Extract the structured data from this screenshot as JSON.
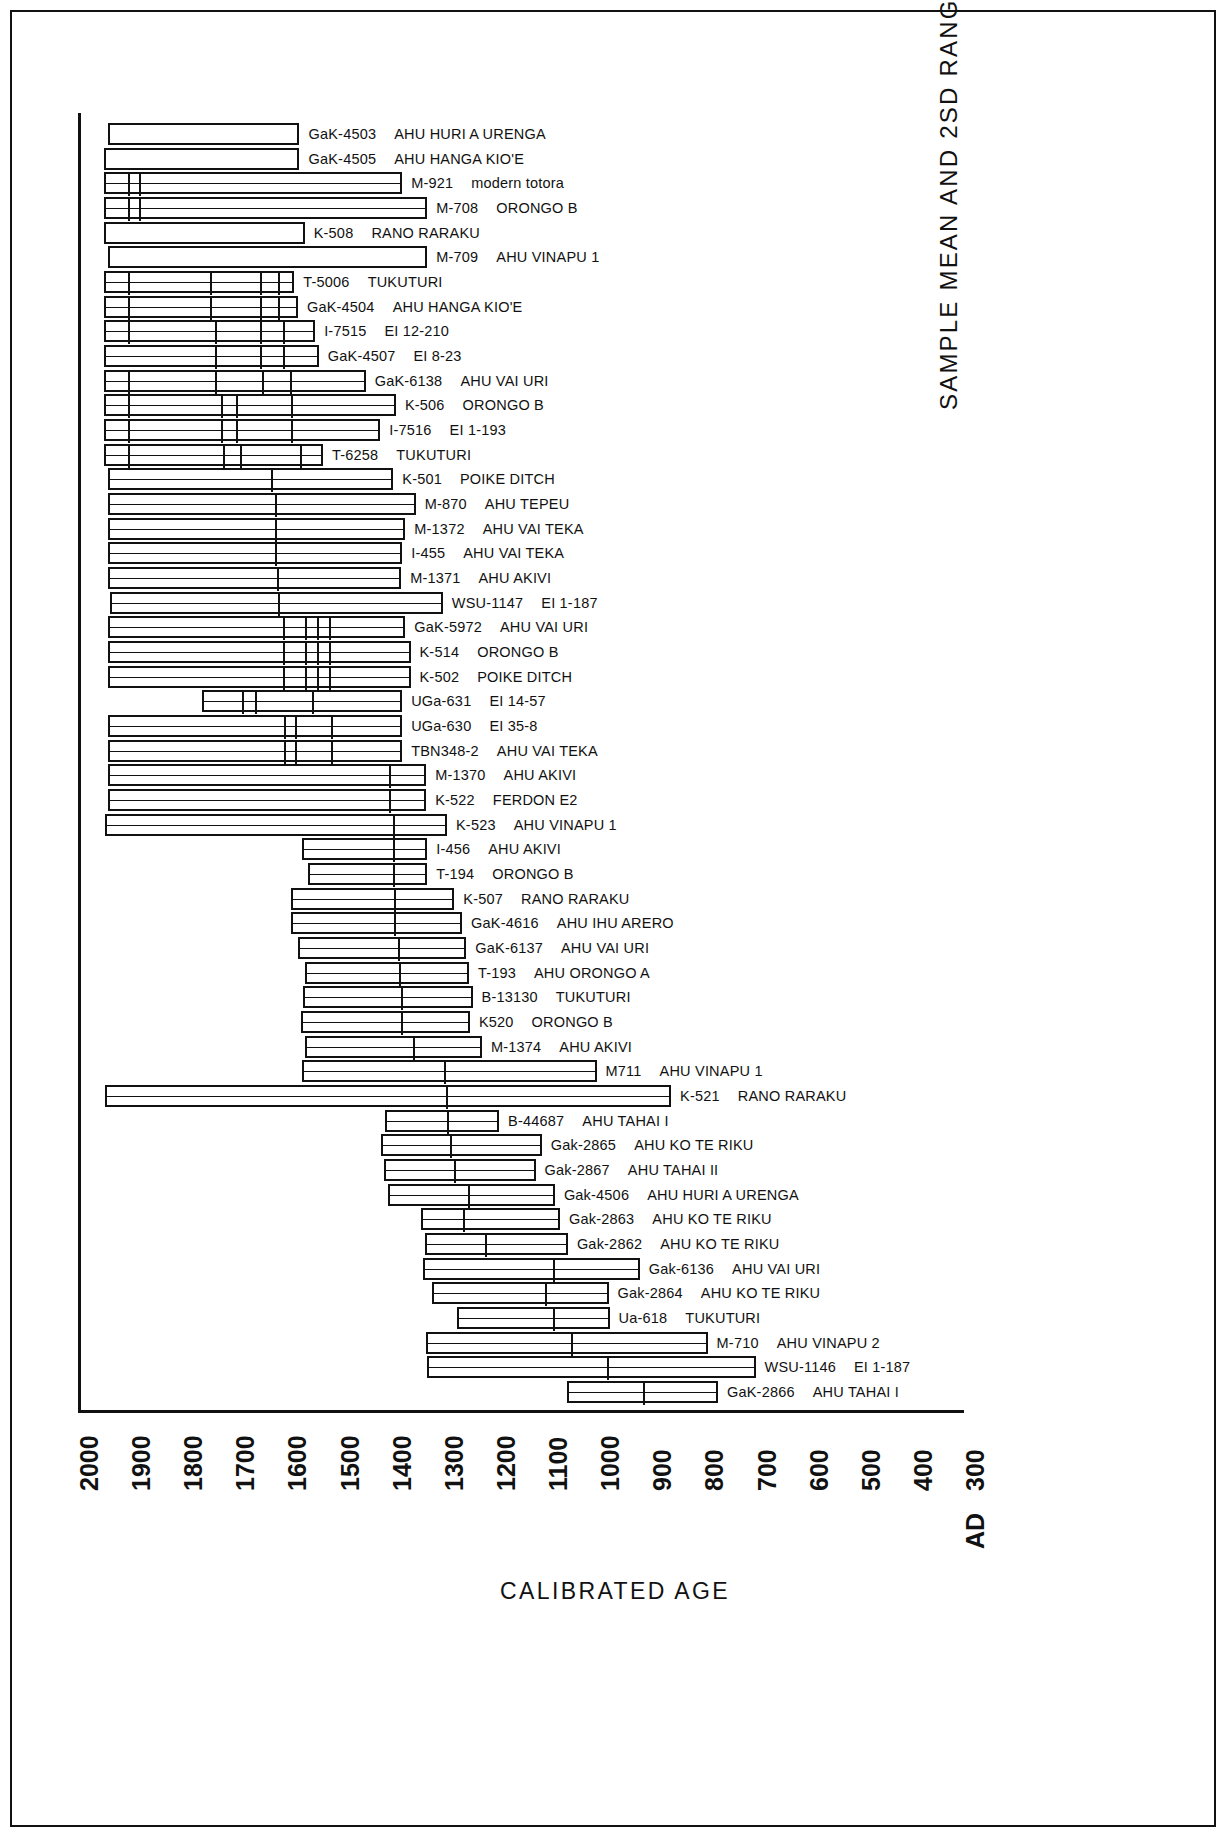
{
  "figure": {
    "xaxis_title": "CALIBRATED  AGE",
    "yaxis_title": "SAMPLE  MEAN  AND  2SD  RANGE"
  },
  "chart_data": {
    "type": "bar",
    "orientation": "horizontal",
    "title": "",
    "xlabel": "CALIBRATED  AGE",
    "ylabel": "SAMPLE  MEAN  AND  2SD  RANGE",
    "xlim": [
      2000,
      300
    ],
    "x_reversed": true,
    "grid": false,
    "legend": null,
    "xticks": [
      "2000",
      "1900",
      "1800",
      "1700",
      "1600",
      "1500",
      "1400",
      "1300",
      "1200",
      "1100",
      "1000",
      "900",
      "800",
      "700",
      "600",
      "500",
      "400",
      "300"
    ],
    "x_tick_values": [
      2000,
      1900,
      1800,
      1700,
      1600,
      1500,
      1400,
      1300,
      1200,
      1100,
      1000,
      900,
      800,
      700,
      600,
      500,
      400,
      300
    ],
    "x_axis_era_prefix": "AD",
    "value_unit": "calibrated years AD",
    "note": "Each bar spans the 2 sigma (2SD) calibrated age range; interior vertical lines mark the sample mean and sub-range divisions.",
    "series": [
      {
        "code": "GaK-4503",
        "site": "AHU  HURI A  URENGA",
        "start": 1942,
        "end": 1575,
        "dividers": []
      },
      {
        "code": "GaK-4505",
        "site": "AHU  HANGA  KIO'E",
        "start": 1950,
        "end": 1575,
        "dividers": []
      },
      {
        "code": "M-921",
        "site": "modern totora",
        "start": 1950,
        "end": 1378,
        "dividers": [
          1908,
          1886
        ]
      },
      {
        "code": "M-708",
        "site": "ORONGO  B",
        "start": 1950,
        "end": 1330,
        "dividers": [
          1908,
          1886
        ]
      },
      {
        "code": "K-508",
        "site": "RANO  RARAKU",
        "start": 1950,
        "end": 1565,
        "dividers": []
      },
      {
        "code": "M-709",
        "site": "AHU  VINAPU  1",
        "start": 1942,
        "end": 1330,
        "dividers": []
      },
      {
        "code": "T-5006",
        "site": "TUKUTURI",
        "start": 1950,
        "end": 1585,
        "dividers": [
          1908,
          1750,
          1655,
          1620
        ]
      },
      {
        "code": "GaK-4504",
        "site": "AHU  HANGA  KIO'E",
        "start": 1950,
        "end": 1578,
        "dividers": [
          1908,
          1750,
          1655,
          1620
        ]
      },
      {
        "code": "I-7515",
        "site": "EI 12-210",
        "start": 1950,
        "end": 1545,
        "dividers": [
          1908,
          1740,
          1655,
          1610
        ]
      },
      {
        "code": "GaK-4507",
        "site": "EI 8-23",
        "start": 1950,
        "end": 1538,
        "dividers": [
          1740,
          1655,
          1610
        ]
      },
      {
        "code": "GaK-6138",
        "site": "AHU  VAI URI",
        "start": 1950,
        "end": 1448,
        "dividers": [
          1908,
          1740,
          1650,
          1597
        ]
      },
      {
        "code": "K-506",
        "site": "ORONGO  B",
        "start": 1950,
        "end": 1390,
        "dividers": [
          1908,
          1730,
          1700,
          1595
        ]
      },
      {
        "code": "I-7516",
        "site": "EI 1-193",
        "start": 1950,
        "end": 1420,
        "dividers": [
          1908,
          1730,
          1700,
          1595
        ]
      },
      {
        "code": "T-6258",
        "site": "TUKUTURI",
        "start": 1950,
        "end": 1530,
        "dividers": [
          1908,
          1725,
          1693,
          1578
        ]
      },
      {
        "code": "K-501",
        "site": "POIKE  DITCH",
        "start": 1942,
        "end": 1395,
        "dividers": [
          1633
        ]
      },
      {
        "code": "M-870",
        "site": "AHU  TEPEU",
        "start": 1942,
        "end": 1352,
        "dividers": [
          1625
        ]
      },
      {
        "code": "M-1372",
        "site": "AHU  VAI TEKA",
        "start": 1942,
        "end": 1372,
        "dividers": [
          1625
        ]
      },
      {
        "code": "I-455",
        "site": "AHU  VAI TEKA",
        "start": 1942,
        "end": 1378,
        "dividers": [
          1625
        ]
      },
      {
        "code": "M-1371",
        "site": "AHU  AKIVI",
        "start": 1942,
        "end": 1380,
        "dividers": [
          1622
        ]
      },
      {
        "code": "WSU-1147",
        "site": "EI 1-187",
        "start": 1938,
        "end": 1300,
        "dividers": [
          1620
        ]
      },
      {
        "code": "GaK-5972",
        "site": "AHU  VAI URI",
        "start": 1942,
        "end": 1372,
        "dividers": [
          1610,
          1568,
          1545,
          1522
        ]
      },
      {
        "code": "K-514",
        "site": "ORONGO  B",
        "start": 1942,
        "end": 1362,
        "dividers": [
          1610,
          1568,
          1545,
          1522
        ]
      },
      {
        "code": "K-502",
        "site": "POIKE  DITCH",
        "start": 1942,
        "end": 1362,
        "dividers": [
          1610,
          1568,
          1545,
          1522
        ]
      },
      {
        "code": "UGa-631",
        "site": "EI 14-57",
        "start": 1762,
        "end": 1378,
        "dividers": [
          1690,
          1665,
          1555
        ]
      },
      {
        "code": "UGa-630",
        "site": "EI 35-8",
        "start": 1942,
        "end": 1378,
        "dividers": [
          1608,
          1588,
          1518
        ]
      },
      {
        "code": "TBN348-2",
        "site": "AHU  VAI TEKA",
        "start": 1942,
        "end": 1378,
        "dividers": [
          1608,
          1588,
          1518
        ]
      },
      {
        "code": "M-1370",
        "site": "AHU  AKIVI",
        "start": 1942,
        "end": 1332,
        "dividers": [
          1408
        ]
      },
      {
        "code": "K-522",
        "site": "FERDON  E2",
        "start": 1942,
        "end": 1332,
        "dividers": [
          1408
        ]
      },
      {
        "code": "K-523",
        "site": "AHU  VINAPU  1",
        "start": 1948,
        "end": 1292,
        "dividers": [
          1400
        ]
      },
      {
        "code": "I-456",
        "site": "AHU  AKIVI",
        "start": 1570,
        "end": 1330,
        "dividers": [
          1400
        ]
      },
      {
        "code": "T-194",
        "site": "ORONGO  B",
        "start": 1558,
        "end": 1330,
        "dividers": [
          1400
        ]
      },
      {
        "code": "K-507",
        "site": "RANO  RARAKU",
        "start": 1592,
        "end": 1278,
        "dividers": [
          1398
        ]
      },
      {
        "code": "GaK-4616",
        "site": "AHU  IHU  ARERO",
        "start": 1592,
        "end": 1263,
        "dividers": [
          1398
        ]
      },
      {
        "code": "GaK-6137",
        "site": "AHU  VAI URI",
        "start": 1578,
        "end": 1255,
        "dividers": [
          1390
        ]
      },
      {
        "code": "T-193",
        "site": "AHU  ORONGO  A",
        "start": 1565,
        "end": 1250,
        "dividers": [
          1388
        ]
      },
      {
        "code": "B-13130",
        "site": "TUKUTURI",
        "start": 1568,
        "end": 1243,
        "dividers": [
          1385
        ]
      },
      {
        "code": "K520",
        "site": "ORONGO  B",
        "start": 1572,
        "end": 1248,
        "dividers": [
          1385
        ]
      },
      {
        "code": "M-1374",
        "site": "AHU  AKIVI",
        "start": 1565,
        "end": 1225,
        "dividers": [
          1362
        ]
      },
      {
        "code": "M711",
        "site": "AHU  VINAPU  1",
        "start": 1570,
        "end": 1005,
        "dividers": [
          1302
        ]
      },
      {
        "code": "K-521",
        "site": "RANO  RARAKU",
        "start": 1948,
        "end": 862,
        "dividers": [
          1298
        ]
      },
      {
        "code": "B-44687",
        "site": "AHU  TAHAI I",
        "start": 1410,
        "end": 1192,
        "dividers": [
          1295
        ]
      },
      {
        "code": "Gak-2865",
        "site": "AHU  KO  TE  RIKU",
        "start": 1418,
        "end": 1110,
        "dividers": [
          1290
        ]
      },
      {
        "code": "Gak-2867",
        "site": "AHU  TAHAI II",
        "start": 1412,
        "end": 1122,
        "dividers": [
          1283
        ]
      },
      {
        "code": "Gak-4506",
        "site": "AHU  HURI A  URENGA",
        "start": 1405,
        "end": 1085,
        "dividers": [
          1255
        ]
      },
      {
        "code": "Gak-2863",
        "site": "AHU  KO  TE  RIKU",
        "start": 1342,
        "end": 1075,
        "dividers": [
          1265
        ]
      },
      {
        "code": "Gak-2862",
        "site": "AHU  KO  TE  RIKU",
        "start": 1335,
        "end": 1060,
        "dividers": [
          1222
        ]
      },
      {
        "code": "Gak-6136",
        "site": "AHU  VAI URI",
        "start": 1338,
        "end": 922,
        "dividers": [
          1092
        ]
      },
      {
        "code": "Gak-2864",
        "site": "AHU  KO  TE  RIKU",
        "start": 1320,
        "end": 982,
        "dividers": [
          1108
        ]
      },
      {
        "code": "Ua-618",
        "site": "TUKUTURI",
        "start": 1272,
        "end": 980,
        "dividers": [
          1092
        ]
      },
      {
        "code": "M-710",
        "site": "AHU  VINAPU  2",
        "start": 1332,
        "end": 792,
        "dividers": [
          1058
        ]
      },
      {
        "code": "WSU-1146",
        "site": "EI 1-187",
        "start": 1330,
        "end": 700,
        "dividers": [
          988
        ]
      },
      {
        "code": "GaK-2866",
        "site": "AHU  TAHAI I",
        "start": 1062,
        "end": 772,
        "dividers": [
          920
        ]
      }
    ]
  }
}
